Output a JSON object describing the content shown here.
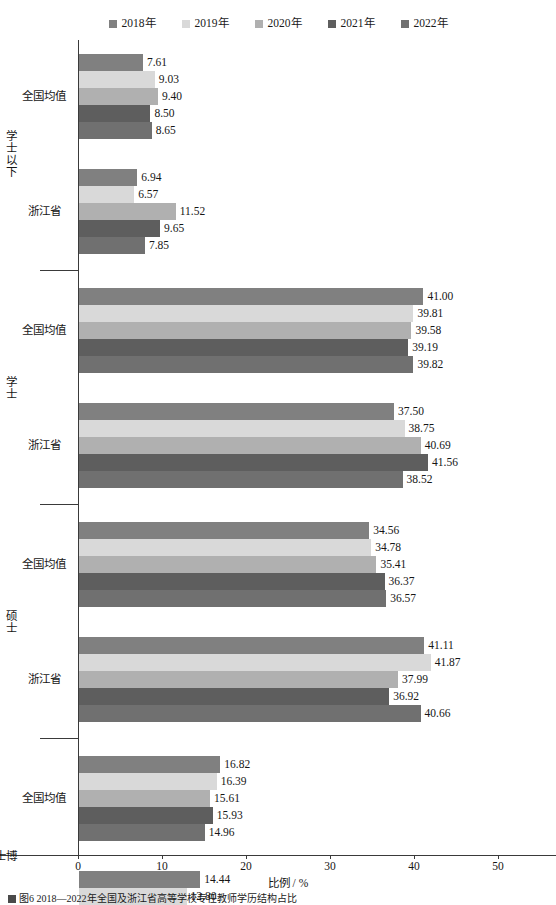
{
  "legend": {
    "position": "top-center",
    "items": [
      {
        "label": "2018年",
        "color": "#808080",
        "icon": "legend-square"
      },
      {
        "label": "2019年",
        "color": "#d9d9d9",
        "icon": "legend-square"
      },
      {
        "label": "2020年",
        "color": "#b0b0b0",
        "icon": "legend-square"
      },
      {
        "label": "2021年",
        "color": "#5e5e5e",
        "icon": "legend-square"
      },
      {
        "label": "2022年",
        "color": "#707070",
        "icon": "legend-square"
      }
    ]
  },
  "axis": {
    "x_title": "比例 / %",
    "x_ticks": [
      "0",
      "10",
      "20",
      "30",
      "40",
      "50"
    ],
    "x_min": 0,
    "x_max": 50
  },
  "caption": {
    "text": "图6 2018—2022年全国及浙江省高等学校专任教师学历结构占比"
  },
  "chart_data": {
    "type": "bar",
    "orientation": "horizontal",
    "title": "",
    "xlabel": "比例 / %",
    "ylabel": "",
    "xlim": [
      0,
      50
    ],
    "grid": false,
    "legend_position": "top-center",
    "series": [
      {
        "name": "2018年",
        "color": "#808080"
      },
      {
        "name": "2019年",
        "color": "#d9d9d9"
      },
      {
        "name": "2020年",
        "color": "#b0b0b0"
      },
      {
        "name": "2021年",
        "color": "#5e5e5e"
      },
      {
        "name": "2022年",
        "color": "#707070"
      }
    ],
    "groups": [
      {
        "major": "学士以下",
        "subgroups": [
          {
            "label": "全国均值",
            "values": [
              7.61,
              9.03,
              9.4,
              8.5,
              8.65
            ]
          },
          {
            "label": "浙江省",
            "values": [
              6.94,
              6.57,
              11.52,
              9.65,
              7.85
            ]
          }
        ]
      },
      {
        "major": "学士",
        "subgroups": [
          {
            "label": "全国均值",
            "values": [
              41.0,
              39.81,
              39.58,
              39.19,
              39.82
            ]
          },
          {
            "label": "浙江省",
            "values": [
              37.5,
              38.75,
              40.69,
              41.56,
              38.52
            ]
          }
        ]
      },
      {
        "major": "硕士",
        "subgroups": [
          {
            "label": "全国均值",
            "values": [
              34.56,
              34.78,
              35.41,
              36.37,
              36.57
            ]
          },
          {
            "label": "浙江省",
            "values": [
              41.11,
              41.87,
              37.99,
              36.92,
              40.66
            ]
          }
        ]
      },
      {
        "major": "博士",
        "subgroups": [
          {
            "label": "全国均值",
            "values": [
              16.82,
              16.39,
              15.61,
              15.93,
              14.96
            ]
          },
          {
            "label": "浙江省",
            "values": [
              14.44,
              12.8,
              9.8,
              11.87,
              12.98
            ]
          }
        ]
      }
    ]
  }
}
